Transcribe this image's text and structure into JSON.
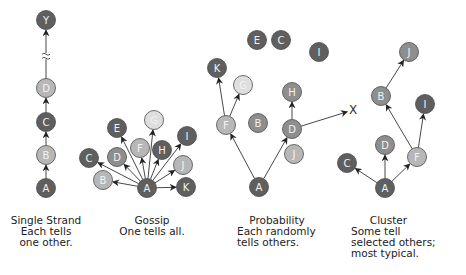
{
  "colors": {
    "dark": "#5f5f5f",
    "mid": "#8e8e8e",
    "light": "#b7b7b7",
    "pale": "#dedede",
    "stroke": "#4a4a4a",
    "edge": "#333333",
    "label": "#f2f2f2"
  },
  "panels": [
    {
      "id": "single-strand",
      "title": "Single Strand",
      "description": [
        "Each tells",
        "one other."
      ],
      "nodes": [
        {
          "id": "Y",
          "shade": "dark"
        },
        {
          "id": "D",
          "shade": "light"
        },
        {
          "id": "C",
          "shade": "dark"
        },
        {
          "id": "B",
          "shade": "light"
        },
        {
          "id": "A",
          "shade": "dark"
        }
      ],
      "edges": [
        [
          "A",
          "B"
        ],
        [
          "B",
          "C"
        ],
        [
          "C",
          "D"
        ],
        [
          "D",
          "Y"
        ]
      ],
      "break_between": [
        "D",
        "Y"
      ]
    },
    {
      "id": "gossip",
      "title": "Gossip",
      "description": [
        "One tells all."
      ],
      "nodes": [
        {
          "id": "A",
          "shade": "dark"
        },
        {
          "id": "B",
          "shade": "light"
        },
        {
          "id": "C",
          "shade": "dark"
        },
        {
          "id": "D",
          "shade": "mid"
        },
        {
          "id": "E",
          "shade": "dark"
        },
        {
          "id": "F",
          "shade": "light"
        },
        {
          "id": "G",
          "shade": "pale"
        },
        {
          "id": "H",
          "shade": "dark"
        },
        {
          "id": "I",
          "shade": "dark"
        },
        {
          "id": "J",
          "shade": "light"
        },
        {
          "id": "K",
          "shade": "dark"
        }
      ],
      "edges": [
        [
          "A",
          "B"
        ],
        [
          "A",
          "C"
        ],
        [
          "A",
          "D"
        ],
        [
          "A",
          "E"
        ],
        [
          "A",
          "F"
        ],
        [
          "A",
          "G"
        ],
        [
          "A",
          "H"
        ],
        [
          "A",
          "I"
        ],
        [
          "A",
          "J"
        ],
        [
          "A",
          "K"
        ]
      ]
    },
    {
      "id": "probability",
      "title": "Probability",
      "description": [
        "Each randomly",
        "tells others."
      ],
      "nodes": [
        {
          "id": "A",
          "shade": "dark"
        },
        {
          "id": "F",
          "shade": "light"
        },
        {
          "id": "K",
          "shade": "dark"
        },
        {
          "id": "G",
          "shade": "pale"
        },
        {
          "id": "B",
          "shade": "mid"
        },
        {
          "id": "D",
          "shade": "mid"
        },
        {
          "id": "J",
          "shade": "light"
        },
        {
          "id": "H",
          "shade": "mid"
        },
        {
          "id": "E",
          "shade": "dark"
        },
        {
          "id": "C",
          "shade": "dark"
        },
        {
          "id": "I",
          "shade": "dark"
        }
      ],
      "edges": [
        [
          "A",
          "F"
        ],
        [
          "A",
          "D"
        ],
        [
          "F",
          "K"
        ],
        [
          "F",
          "G"
        ],
        [
          "D",
          "H"
        ],
        [
          "D",
          "X"
        ]
      ],
      "terminal_mark": "X"
    },
    {
      "id": "cluster",
      "title": "Cluster",
      "description": [
        "Some tell",
        "selected others;",
        "most typical."
      ],
      "nodes": [
        {
          "id": "A",
          "shade": "dark"
        },
        {
          "id": "C",
          "shade": "dark"
        },
        {
          "id": "D",
          "shade": "mid"
        },
        {
          "id": "F",
          "shade": "light"
        },
        {
          "id": "B",
          "shade": "mid"
        },
        {
          "id": "I",
          "shade": "dark"
        },
        {
          "id": "J",
          "shade": "mid"
        }
      ],
      "edges": [
        [
          "A",
          "C"
        ],
        [
          "A",
          "D"
        ],
        [
          "A",
          "F"
        ],
        [
          "F",
          "B"
        ],
        [
          "F",
          "I"
        ],
        [
          "B",
          "J"
        ]
      ]
    }
  ]
}
